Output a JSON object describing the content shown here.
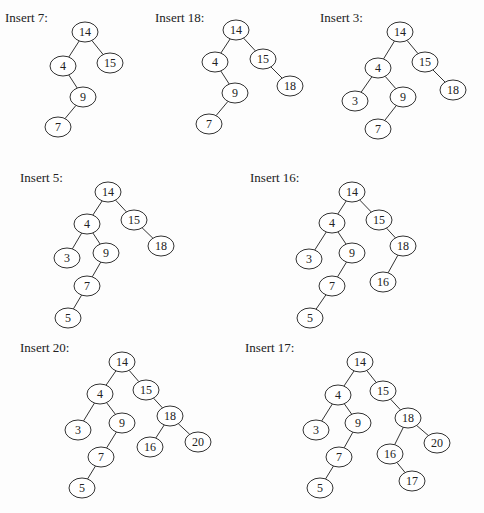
{
  "figure": {
    "node_rx": 13,
    "node_ry": 10,
    "stroke_color": "#333333",
    "text_color": "#222222",
    "background": "#fdfdfd"
  },
  "panels": [
    {
      "label": "Insert 7:",
      "label_pos": [
        5,
        20
      ],
      "nodes": [
        {
          "key": "14",
          "x": 85,
          "y": 32
        },
        {
          "key": "4",
          "x": 63,
          "y": 66
        },
        {
          "key": "15",
          "x": 110,
          "y": 63
        },
        {
          "key": "9",
          "x": 83,
          "y": 97
        },
        {
          "key": "7",
          "x": 58,
          "y": 127
        }
      ],
      "edges": [
        [
          "14",
          "4"
        ],
        [
          "14",
          "15"
        ],
        [
          "4",
          "9"
        ],
        [
          "9",
          "7"
        ]
      ]
    },
    {
      "label": "Insert 18:",
      "label_pos": [
        155,
        20
      ],
      "nodes": [
        {
          "key": "14",
          "x": 236,
          "y": 30
        },
        {
          "key": "4",
          "x": 215,
          "y": 62
        },
        {
          "key": "15",
          "x": 263,
          "y": 59
        },
        {
          "key": "18",
          "x": 290,
          "y": 86
        },
        {
          "key": "9",
          "x": 235,
          "y": 93
        },
        {
          "key": "7",
          "x": 209,
          "y": 124
        }
      ],
      "edges": [
        [
          "14",
          "4"
        ],
        [
          "14",
          "15"
        ],
        [
          "15",
          "18"
        ],
        [
          "4",
          "9"
        ],
        [
          "9",
          "7"
        ]
      ]
    },
    {
      "label": "Insert 3:",
      "label_pos": [
        320,
        20
      ],
      "nodes": [
        {
          "key": "14",
          "x": 400,
          "y": 32
        },
        {
          "key": "4",
          "x": 378,
          "y": 68
        },
        {
          "key": "15",
          "x": 425,
          "y": 62
        },
        {
          "key": "18",
          "x": 453,
          "y": 90
        },
        {
          "key": "3",
          "x": 355,
          "y": 101
        },
        {
          "key": "9",
          "x": 403,
          "y": 97
        },
        {
          "key": "7",
          "x": 378,
          "y": 129
        }
      ],
      "edges": [
        [
          "14",
          "4"
        ],
        [
          "14",
          "15"
        ],
        [
          "15",
          "18"
        ],
        [
          "4",
          "3"
        ],
        [
          "4",
          "9"
        ],
        [
          "9",
          "7"
        ]
      ]
    },
    {
      "label": "Insert 5:",
      "label_pos": [
        20,
        180
      ],
      "nodes": [
        {
          "key": "14",
          "x": 108,
          "y": 192
        },
        {
          "key": "4",
          "x": 87,
          "y": 224
        },
        {
          "key": "15",
          "x": 134,
          "y": 220
        },
        {
          "key": "18",
          "x": 161,
          "y": 246
        },
        {
          "key": "3",
          "x": 67,
          "y": 258
        },
        {
          "key": "9",
          "x": 106,
          "y": 253
        },
        {
          "key": "7",
          "x": 87,
          "y": 286
        },
        {
          "key": "5",
          "x": 68,
          "y": 318
        }
      ],
      "edges": [
        [
          "14",
          "4"
        ],
        [
          "14",
          "15"
        ],
        [
          "15",
          "18"
        ],
        [
          "4",
          "3"
        ],
        [
          "4",
          "9"
        ],
        [
          "9",
          "7"
        ],
        [
          "7",
          "5"
        ]
      ]
    },
    {
      "label": "Insert 16:",
      "label_pos": [
        250,
        180
      ],
      "nodes": [
        {
          "key": "14",
          "x": 352,
          "y": 192
        },
        {
          "key": "4",
          "x": 332,
          "y": 223
        },
        {
          "key": "15",
          "x": 379,
          "y": 220
        },
        {
          "key": "18",
          "x": 403,
          "y": 246
        },
        {
          "key": "16",
          "x": 383,
          "y": 282
        },
        {
          "key": "3",
          "x": 309,
          "y": 259
        },
        {
          "key": "9",
          "x": 352,
          "y": 253
        },
        {
          "key": "7",
          "x": 332,
          "y": 286
        },
        {
          "key": "5",
          "x": 310,
          "y": 318
        }
      ],
      "edges": [
        [
          "14",
          "4"
        ],
        [
          "14",
          "15"
        ],
        [
          "15",
          "18"
        ],
        [
          "18",
          "16"
        ],
        [
          "4",
          "3"
        ],
        [
          "4",
          "9"
        ],
        [
          "9",
          "7"
        ],
        [
          "7",
          "5"
        ]
      ]
    },
    {
      "label": "Insert 20:",
      "label_pos": [
        20,
        350
      ],
      "nodes": [
        {
          "key": "14",
          "x": 122,
          "y": 362
        },
        {
          "key": "4",
          "x": 100,
          "y": 394
        },
        {
          "key": "15",
          "x": 146,
          "y": 390
        },
        {
          "key": "18",
          "x": 170,
          "y": 416
        },
        {
          "key": "16",
          "x": 150,
          "y": 447
        },
        {
          "key": "20",
          "x": 198,
          "y": 442
        },
        {
          "key": "3",
          "x": 78,
          "y": 430
        },
        {
          "key": "9",
          "x": 122,
          "y": 423
        },
        {
          "key": "7",
          "x": 101,
          "y": 457
        },
        {
          "key": "5",
          "x": 82,
          "y": 488
        }
      ],
      "edges": [
        [
          "14",
          "4"
        ],
        [
          "14",
          "15"
        ],
        [
          "15",
          "18"
        ],
        [
          "18",
          "16"
        ],
        [
          "18",
          "20"
        ],
        [
          "4",
          "3"
        ],
        [
          "4",
          "9"
        ],
        [
          "9",
          "7"
        ],
        [
          "7",
          "5"
        ]
      ]
    },
    {
      "label": "Insert 17:",
      "label_pos": [
        245,
        350
      ],
      "nodes": [
        {
          "key": "14",
          "x": 360,
          "y": 362
        },
        {
          "key": "4",
          "x": 338,
          "y": 395
        },
        {
          "key": "15",
          "x": 383,
          "y": 391
        },
        {
          "key": "18",
          "x": 408,
          "y": 418
        },
        {
          "key": "16",
          "x": 390,
          "y": 454
        },
        {
          "key": "17",
          "x": 412,
          "y": 481
        },
        {
          "key": "20",
          "x": 437,
          "y": 443
        },
        {
          "key": "3",
          "x": 316,
          "y": 430
        },
        {
          "key": "9",
          "x": 358,
          "y": 423
        },
        {
          "key": "7",
          "x": 339,
          "y": 457
        },
        {
          "key": "5",
          "x": 320,
          "y": 488
        }
      ],
      "edges": [
        [
          "14",
          "4"
        ],
        [
          "14",
          "15"
        ],
        [
          "15",
          "18"
        ],
        [
          "18",
          "16"
        ],
        [
          "16",
          "17"
        ],
        [
          "18",
          "20"
        ],
        [
          "4",
          "3"
        ],
        [
          "4",
          "9"
        ],
        [
          "9",
          "7"
        ],
        [
          "7",
          "5"
        ]
      ]
    }
  ]
}
